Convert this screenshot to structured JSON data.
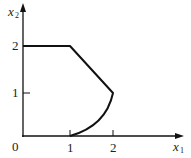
{
  "diagram": {
    "type": "feasible-region-plot",
    "axes": {
      "x": {
        "label": "x",
        "subscript": "1",
        "ticks": [
          "1",
          "2"
        ]
      },
      "y": {
        "label": "x",
        "subscript": "2",
        "ticks": [
          "1",
          "2"
        ]
      },
      "origin_label": "0"
    },
    "boundary": {
      "segments": [
        {
          "kind": "line",
          "from": [
            0,
            2
          ],
          "to": [
            1,
            2
          ]
        },
        {
          "kind": "line",
          "from": [
            1,
            2
          ],
          "to": [
            2,
            1
          ]
        },
        {
          "kind": "curve",
          "from": [
            2,
            1
          ],
          "to": [
            1,
            0
          ]
        }
      ]
    },
    "colors": {
      "stroke": "#111111",
      "background": "#ffffff"
    }
  }
}
